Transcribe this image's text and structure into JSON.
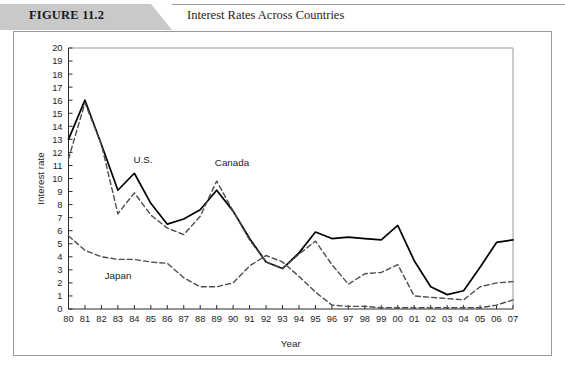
{
  "header": {
    "figure_label": "FIGURE 11.2",
    "title": "Interest Rates Across Countries",
    "band_color": "#c9c9c9"
  },
  "chart_data": {
    "type": "line",
    "title": "Interest Rates Across Countries",
    "xlabel": "Year",
    "ylabel": "Interest rate",
    "xlim": [
      0,
      27
    ],
    "ylim": [
      0,
      20
    ],
    "ytick_step": 1,
    "grid": false,
    "legend_position": "inline-annotations",
    "categories": [
      "80",
      "81",
      "82",
      "83",
      "84",
      "85",
      "86",
      "87",
      "88",
      "89",
      "90",
      "91",
      "92",
      "93",
      "94",
      "95",
      "96",
      "97",
      "98",
      "99",
      "00",
      "01",
      "02",
      "03",
      "04",
      "05",
      "06",
      "07"
    ],
    "series": [
      {
        "name": "U.S.",
        "style": "solid",
        "color": "#000000",
        "label_x": 143,
        "label_y": 163,
        "values": [
          13.0,
          16.0,
          12.6,
          9.1,
          10.4,
          8.1,
          6.5,
          6.9,
          7.6,
          9.1,
          7.5,
          5.4,
          3.6,
          3.1,
          4.3,
          5.9,
          5.4,
          5.5,
          5.4,
          5.3,
          6.4,
          3.7,
          1.7,
          1.1,
          1.4,
          3.2,
          5.1,
          5.3
        ]
      },
      {
        "name": "Canada",
        "style": "dashed",
        "color": "#4d4d4d",
        "label_x": 232,
        "label_y": 166,
        "values": [
          11.5,
          15.8,
          12.6,
          7.3,
          8.9,
          7.2,
          6.2,
          5.7,
          7.1,
          9.8,
          7.5,
          5.3,
          3.6,
          3.1,
          4.2,
          5.2,
          3.4,
          1.9,
          2.7,
          2.8,
          3.4,
          1.0,
          0.9,
          0.8,
          0.7,
          1.7,
          2.0,
          2.1
        ]
      },
      {
        "name": "Japan",
        "style": "dashed",
        "color": "#4d4d4d",
        "label_x": 118,
        "label_y": 279,
        "values": [
          5.6,
          4.5,
          4.0,
          3.8,
          3.8,
          3.6,
          3.5,
          2.4,
          1.7,
          1.7,
          2.0,
          3.3,
          4.1,
          3.6,
          2.5,
          1.3,
          0.3,
          0.2,
          0.2,
          0.1,
          0.1,
          0.1,
          0.1,
          0.1,
          0.1,
          0.1,
          0.3,
          0.7
        ]
      }
    ]
  }
}
